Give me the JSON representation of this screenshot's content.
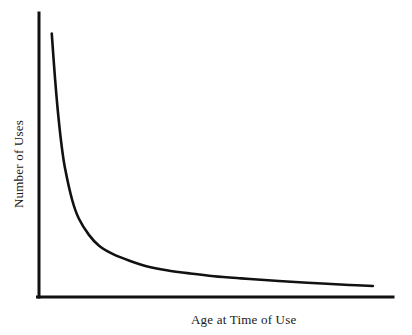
{
  "chart_data": {
    "type": "line",
    "title": "",
    "subtitle": "",
    "xlabel": "Age at Time of Use",
    "ylabel": "Number of Uses",
    "legend": [],
    "annotations": [],
    "grid": false,
    "legend_position": "none",
    "axis_style": {
      "x_axis_visible": true,
      "y_axis_visible": true,
      "x_ticks": [],
      "y_ticks": [],
      "xtick_labels": [],
      "ytick_labels": [],
      "spines": [
        "left",
        "bottom"
      ]
    },
    "xlim": [
      0,
      100
    ],
    "ylim": [
      0,
      100
    ],
    "series": [
      {
        "name": "Number of Uses by Age",
        "x": [
          2,
          3,
          4,
          5,
          6,
          8,
          10,
          13,
          16,
          20,
          25,
          30,
          36,
          43,
          50,
          58,
          66,
          74,
          82,
          90,
          97
        ],
        "values": [
          95,
          78,
          64,
          53,
          45,
          34,
          27,
          21,
          17,
          14,
          11.5,
          9.5,
          8,
          6.8,
          5.8,
          5,
          4.3,
          3.7,
          3.1,
          2.6,
          2.2
        ]
      }
    ],
    "colors": {
      "curve": "#111111",
      "axis": "#111111",
      "background": "#ffffff",
      "text": "#1a1a1a"
    }
  },
  "labels": {
    "x_axis": "Age at Time of Use",
    "y_axis": "Number of Uses"
  }
}
